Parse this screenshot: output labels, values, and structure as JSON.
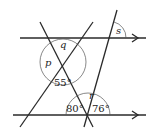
{
  "diagram": {
    "angles": {
      "p": "p",
      "q": "q",
      "r": "r",
      "s": "s",
      "a55": "55°",
      "a80": "80°",
      "a76": "76°"
    }
  }
}
